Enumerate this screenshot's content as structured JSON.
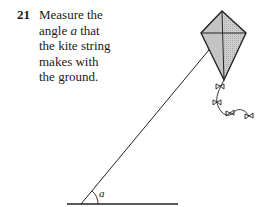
{
  "question": {
    "number": "21",
    "lines": [
      {
        "text": "Measure the"
      },
      {
        "before": "angle ",
        "var": "a",
        "after": " that"
      },
      {
        "text": "the kite string"
      },
      {
        "text": "makes with"
      },
      {
        "text": "the ground."
      }
    ]
  },
  "figure": {
    "angle_label": "a",
    "colors": {
      "line": "#222222",
      "kite_fill": "#c8c8c8"
    }
  }
}
